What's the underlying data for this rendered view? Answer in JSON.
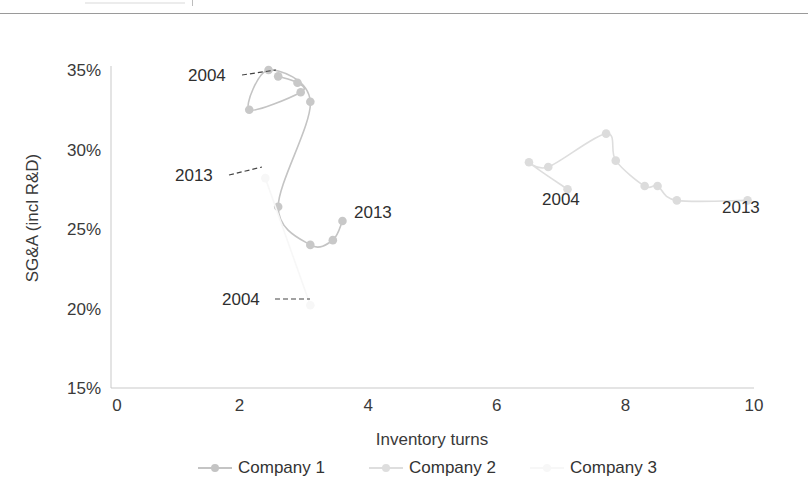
{
  "chart_data": {
    "type": "line",
    "title": "",
    "xlabel": "Inventory turns",
    "ylabel": "SG&A (incl R&D)",
    "xlim": [
      0,
      10
    ],
    "ylim": [
      15,
      35
    ],
    "x_ticks": [
      "0",
      "2",
      "4",
      "6",
      "8",
      "10"
    ],
    "y_ticks": [
      "15%",
      "20%",
      "25%",
      "30%",
      "35%"
    ],
    "grid": false,
    "legend_position": "bottom",
    "series": [
      {
        "name": "Company 1",
        "color": "#c4c4c4",
        "marker_color": "#c8c8c8",
        "years": [
          "2004",
          "2005",
          "2006",
          "2007",
          "2008",
          "2009",
          "2010",
          "2011",
          "2012",
          "2013"
        ],
        "x": [
          2.6,
          2.9,
          2.95,
          2.15,
          2.45,
          3.1,
          2.6,
          3.1,
          3.45,
          3.6
        ],
        "y": [
          34.6,
          34.2,
          33.6,
          32.5,
          35.0,
          33.0,
          26.4,
          24.0,
          24.3,
          25.5
        ]
      },
      {
        "name": "Company 2",
        "color": "#dedede",
        "marker_color": "#dcdcdc",
        "years": [
          "2004",
          "2005",
          "2006",
          "2007",
          "2008",
          "2009",
          "2010",
          "2011",
          "2013"
        ],
        "x": [
          7.1,
          6.5,
          6.8,
          7.7,
          7.85,
          8.3,
          8.5,
          8.8,
          9.9
        ],
        "y": [
          27.5,
          29.2,
          28.9,
          31.0,
          29.3,
          27.7,
          27.7,
          26.8,
          26.8
        ]
      },
      {
        "name": "Company 3",
        "color": "#f7f7f7",
        "marker_color": "#f7f7f7",
        "years": [
          "2004",
          "2013"
        ],
        "x": [
          3.1,
          2.4
        ],
        "y": [
          20.2,
          28.2
        ]
      }
    ],
    "annotations": [
      {
        "text": "2004",
        "series": "Company 1",
        "dashed_leader": true
      },
      {
        "text": "2013",
        "series": "Company 1",
        "dashed_leader": false
      },
      {
        "text": "2004",
        "series": "Company 2",
        "dashed_leader": false
      },
      {
        "text": "2013",
        "series": "Company 2",
        "dashed_leader": false
      },
      {
        "text": "2004",
        "series": "Company 3",
        "dashed_leader": true
      },
      {
        "text": "2013",
        "series": "Company 3",
        "dashed_leader": true
      }
    ]
  },
  "labels": {
    "c1_start": "2004",
    "c1_end": "2013",
    "c2_start": "2004",
    "c2_end": "2013",
    "c3_start": "2004",
    "c3_end": "2013"
  },
  "legend": [
    {
      "label": "Company 1",
      "color": "#c4c4c4"
    },
    {
      "label": "Company 2",
      "color": "#dedede"
    },
    {
      "label": "Company 3",
      "color": "#f7f7f7"
    }
  ]
}
